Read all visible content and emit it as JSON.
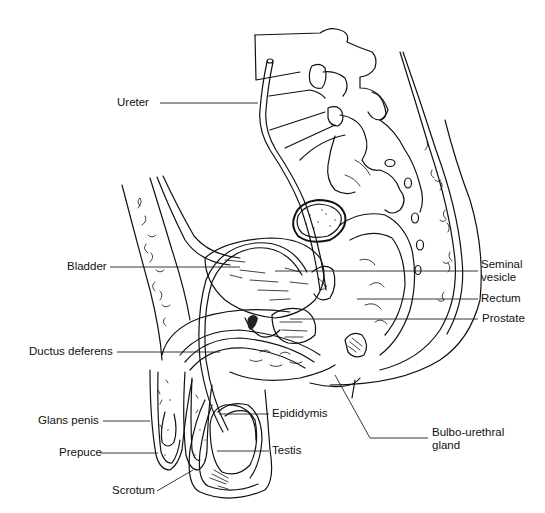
{
  "figure": {
    "labels": {
      "ureter": "Ureter",
      "bladder": "Bladder",
      "ductus_deferens": "Ductus deferens",
      "glans_penis": "Glans penis",
      "prepuce": "Prepuce",
      "scrotum": "Scrotum",
      "seminal_vesicle_line1": "Seminal",
      "seminal_vesicle_line2": "vesicle",
      "rectum": "Rectum",
      "prostate": "Prostate",
      "epididymis": "Epididymis",
      "testis": "Testis",
      "bulbo_urethral_line1": "Bulbo-urethral",
      "bulbo_urethral_line2": "gland"
    },
    "colors": {
      "line": "#111111",
      "background": "#ffffff"
    }
  }
}
